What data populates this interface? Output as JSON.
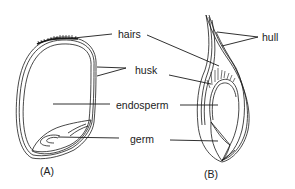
{
  "diagram": {
    "labels": {
      "hairs": "hairs",
      "husk": "husk",
      "endosperm": "endosperm",
      "germ": "germ",
      "hull": "hull"
    },
    "panels": {
      "a": "(A)",
      "b": "(B)"
    },
    "colors": {
      "line": "#1a1a1a",
      "text": "#222222",
      "background": "#ffffff"
    }
  }
}
